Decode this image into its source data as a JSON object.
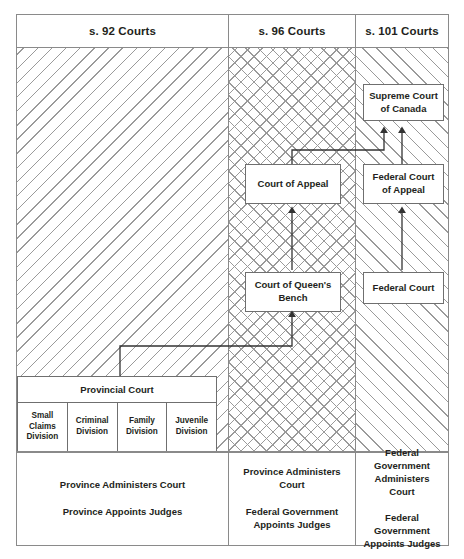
{
  "diagram": {
    "columns": [
      {
        "id": "s92",
        "header": "s. 92 Courts"
      },
      {
        "id": "s96",
        "header": "s. 96 Courts"
      },
      {
        "id": "s101",
        "header": "s. 101 Courts"
      }
    ],
    "nodes": {
      "supreme_court": "Supreme Court\nof Canada",
      "supreme_court_line1": "Supreme Court",
      "supreme_court_line2": "of Canada",
      "court_of_appeal": "Court of Appeal",
      "federal_court_of_appeal_line1": "Federal Court",
      "federal_court_of_appeal_line2": "of Appeal",
      "queens_bench_line1": "Court of Queen's",
      "queens_bench_line2": "Bench",
      "federal_court": "Federal Court",
      "provincial_court": "Provincial Court"
    },
    "divisions": [
      {
        "line1": "Small",
        "line2": "Claims",
        "line3": "Division"
      },
      {
        "line1": "Criminal",
        "line2": "Division",
        "line3": ""
      },
      {
        "line1": "Family",
        "line2": "Division",
        "line3": ""
      },
      {
        "line1": "Juvenile",
        "line2": "Division",
        "line3": ""
      }
    ],
    "footers": [
      {
        "id": "s92",
        "lines": [
          "Province Administers Court",
          "Province Appoints Judges"
        ]
      },
      {
        "id": "s96",
        "lines": [
          "Province Administers Court",
          "Federal Government\nAppoints Judges"
        ]
      },
      {
        "id": "s101",
        "lines": [
          "Federal Government\nAdministers Court",
          "Federal Government\nAppoints Judges"
        ]
      }
    ],
    "footer_text": {
      "s92_line1": "Province Administers Court",
      "s92_line2": "Province Appoints Judges",
      "s96_line1": "Province Administers Court",
      "s96_line2a": "Federal Government",
      "s96_line2b": "Appoints Judges",
      "s101_line1a": "Federal Government",
      "s101_line1b": "Administers Court",
      "s101_line2a": "Federal Government",
      "s101_line2b": "Appoints Judges"
    },
    "colors": {
      "frame": "#8a8a8a",
      "node_border": "#6f6f6f",
      "hatch": "#9a9a9a",
      "text": "#231f20",
      "connector": "#333333"
    },
    "hatch_styles": {
      "s92": "diagonal-down",
      "s96": "cross-hatch",
      "s101": "diagonal-up"
    },
    "appeal_flows": [
      {
        "from": "Provincial Court",
        "to": "Court of Queen's Bench"
      },
      {
        "from": "Court of Queen's Bench",
        "to": "Court of Appeal"
      },
      {
        "from": "Court of Appeal",
        "to": "Supreme Court of Canada"
      },
      {
        "from": "Federal Court",
        "to": "Federal Court of Appeal"
      },
      {
        "from": "Federal Court of Appeal",
        "to": "Supreme Court of Canada"
      }
    ]
  }
}
